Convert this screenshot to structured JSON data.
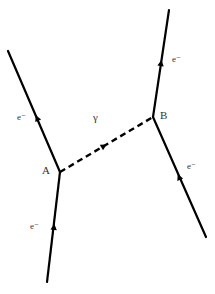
{
  "diagram": {
    "type": "feynman",
    "title": "",
    "vertices": [
      {
        "id": "A",
        "label": "A",
        "x": 60,
        "y": 172,
        "label_x": 42,
        "label_y": 174
      },
      {
        "id": "B",
        "label": "B",
        "x": 153,
        "y": 117,
        "label_x": 160,
        "label_y": 119
      }
    ],
    "fermion_lines": [
      {
        "name": "incoming-electron-A",
        "label": "e⁻",
        "x1": 47,
        "y1": 282,
        "x2": 60,
        "y2": 172,
        "arrow_x": 54,
        "arrow_y": 227,
        "label_x": 30,
        "label_y": 229
      },
      {
        "name": "outgoing-electron-A",
        "label": "e⁻",
        "x1": 60,
        "y1": 172,
        "x2": 8,
        "y2": 51,
        "arrow_x": 37,
        "arrow_y": 118,
        "label_x": 17,
        "label_y": 120
      },
      {
        "name": "incoming-electron-B",
        "label": "e⁻",
        "x1": 206,
        "y1": 237,
        "x2": 153,
        "y2": 117,
        "arrow_x": 179,
        "arrow_y": 177,
        "label_x": 187,
        "label_y": 169
      },
      {
        "name": "outgoing-electron-B",
        "label": "e⁻",
        "x1": 153,
        "y1": 117,
        "x2": 169,
        "y2": 10,
        "arrow_x": 161,
        "arrow_y": 63,
        "label_x": 172,
        "label_y": 62
      }
    ],
    "photon": {
      "label": "γ",
      "x1": 60,
      "y1": 172,
      "x2": 153,
      "y2": 117,
      "arrow_x": 104,
      "arrow_y": 146,
      "label_x": 93,
      "label_y": 121
    },
    "colors": {
      "line": "#000000",
      "label": "#333333",
      "background": "#ffffff"
    }
  }
}
